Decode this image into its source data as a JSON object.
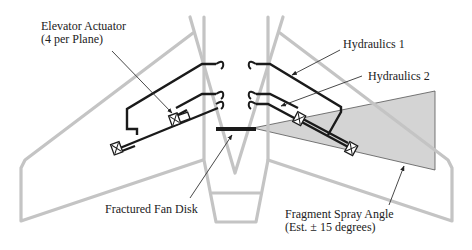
{
  "diagram": {
    "labels": {
      "elevator_actuator_line1": "Elevator Actuator",
      "elevator_actuator_line2": "(4 per Plane)",
      "hydraulics_1": "Hydraulics 1",
      "hydraulics_2": "Hydraulics 2",
      "fractured_fan_disk": "Fractured Fan Disk",
      "fragment_spray_line1": "Fragment Spray Angle",
      "fragment_spray_line2": "(Est. ± 15 degrees)"
    },
    "colors": {
      "structure_outline": "#c4c4c4",
      "hydraulic_lines": "#1a1a1a",
      "spray_fill": "#d4d4d4",
      "background": "#ffffff"
    }
  }
}
